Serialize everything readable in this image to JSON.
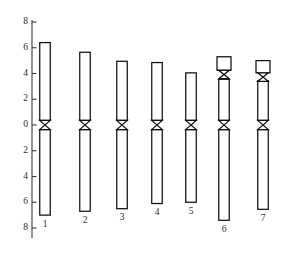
{
  "figure": {
    "title": "",
    "background_color": "#ffffff",
    "outline_color": "#111111",
    "axis_color": "#3a3a3a",
    "fill_color": "#ffffff"
  },
  "axis": {
    "name": "chromosome-length-axis",
    "orientation": "vertical",
    "label": "",
    "top_value": 8,
    "bottom_value": -8,
    "tick_labels": [
      "8",
      "6",
      "4",
      "2",
      "0",
      "2",
      "4",
      "6",
      "8"
    ],
    "tick_values": [
      8,
      6,
      4,
      2,
      0,
      -2,
      -4,
      -6,
      -8
    ],
    "zero_label": "0"
  },
  "chart_data": {
    "type": "bar",
    "title": "",
    "xlabel": "",
    "ylabel": "",
    "ylim": [
      -8,
      8
    ],
    "grid": false,
    "legend": "none",
    "categories": [
      "1",
      "2",
      "3",
      "4",
      "5",
      "6",
      "7"
    ],
    "series": [
      {
        "name": "short arm (p) length",
        "values": [
          6.4,
          5.65,
          4.95,
          4.85,
          4.05,
          3.55,
          3.45
        ]
      },
      {
        "name": "long arm (q) length",
        "values": [
          7.0,
          6.7,
          6.5,
          6.1,
          6.0,
          7.4,
          6.55
        ]
      },
      {
        "name": "satellite top",
        "values": [
          0,
          0,
          0,
          0,
          0,
          5.3,
          5.0
        ]
      }
    ]
  },
  "chromosomes": [
    {
      "label": "1",
      "name": "chromosome-1",
      "p_arm_top": 6.4,
      "q_arm_bottom": -7.0,
      "has_satellite": false,
      "satellite_top": null,
      "satellite_bottom": null,
      "width": 10.5,
      "center_x": 45
    },
    {
      "label": "2",
      "name": "chromosome-2",
      "p_arm_top": 5.65,
      "q_arm_bottom": -6.7,
      "has_satellite": false,
      "satellite_top": null,
      "satellite_bottom": null,
      "width": 10.5,
      "center_x": 85
    },
    {
      "label": "3",
      "name": "chromosome-3",
      "p_arm_top": 4.95,
      "q_arm_bottom": -6.5,
      "has_satellite": false,
      "satellite_top": null,
      "satellite_bottom": null,
      "width": 10.5,
      "center_x": 122
    },
    {
      "label": "4",
      "name": "chromosome-4",
      "p_arm_top": 4.85,
      "q_arm_bottom": -6.1,
      "has_satellite": false,
      "satellite_top": null,
      "satellite_bottom": null,
      "width": 10.5,
      "center_x": 157
    },
    {
      "label": "5",
      "name": "chromosome-5",
      "p_arm_top": 4.05,
      "q_arm_bottom": -6.0,
      "has_satellite": false,
      "satellite_top": null,
      "satellite_bottom": null,
      "width": 10.5,
      "center_x": 191
    },
    {
      "label": "6",
      "name": "chromosome-6",
      "p_arm_top": 3.55,
      "q_arm_bottom": -7.4,
      "has_satellite": true,
      "satellite_top": 5.3,
      "satellite_bottom": 4.25,
      "width": 10.5,
      "center_x": 224
    },
    {
      "label": "7",
      "name": "chromosome-7",
      "p_arm_top": 3.45,
      "q_arm_bottom": -6.55,
      "has_satellite": true,
      "satellite_top": 5.0,
      "satellite_bottom": 4.05,
      "width": 10.5,
      "center_x": 263
    }
  ]
}
